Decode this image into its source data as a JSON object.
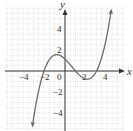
{
  "chart_data": {
    "type": "line",
    "title": "",
    "xlabel": "x",
    "ylabel": "y",
    "xlim": [
      -5.7,
      5.6
    ],
    "ylim": [
      -5.5,
      6.0
    ],
    "grid": true,
    "grid_step": 0.5,
    "x_ticks": [
      -4,
      -2,
      0,
      2,
      4
    ],
    "y_ticks": [
      4,
      2,
      -2,
      -4
    ],
    "x_tick_labels": [
      "−4",
      "−2",
      "0",
      "2",
      "4"
    ],
    "y_tick_labels": [
      "4",
      "2",
      "−2",
      "−4"
    ],
    "series": [
      {
        "name": "f(x)",
        "description": "cubic curve with arrows at both ends, roots near x=-2, 1, 3; local max ~1.5 near x=-0.5; local min ~-0.8 near x=2",
        "x": [
          -3.1,
          -2.5,
          -2.0,
          -1.5,
          -1.0,
          -0.5,
          0.0,
          0.5,
          1.0,
          1.5,
          2.0,
          2.5,
          3.0,
          3.5,
          4.0,
          4.4
        ],
        "y": [
          -5.4,
          -2.3,
          0.0,
          1.2,
          1.5,
          1.5,
          1.1,
          0.6,
          0.0,
          -0.5,
          -0.8,
          -0.6,
          0.0,
          1.2,
          3.4,
          5.8
        ]
      }
    ],
    "colors": {
      "curve": "#6b6b6b",
      "axis": "#333333",
      "grid": "#cfcfcf"
    }
  }
}
